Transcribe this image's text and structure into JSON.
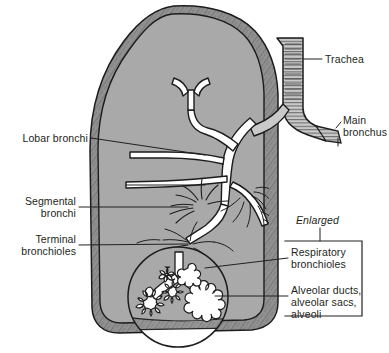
{
  "figure": {
    "width": 389,
    "height": 353,
    "background_color": "#ffffff"
  },
  "colors": {
    "lung_interior": "#a9a9a9",
    "pleura_border": "#909090",
    "ink": "#231f20",
    "airway_lumen": "#ffffff",
    "leader_line": "#231f20",
    "bracket": "#231f20"
  },
  "labels": {
    "trachea": "Trachea",
    "main_bronchus_line1": "Main",
    "main_bronchus_line2": "bronchus",
    "lobar_bronchi": "Lobar bronchi",
    "segmental_line1": "Segmental",
    "segmental_line2": "bronchi",
    "terminal_line1": "Terminal",
    "terminal_line2": "bronchioles",
    "enlarged": "Enlarged",
    "respiratory_line1": "Respiratory",
    "respiratory_line2": "bronchioles",
    "alveolar_line1": "Alveolar ducts,",
    "alveolar_line2": "alveolar sacs,",
    "alveolar_line3": "alveoli"
  },
  "structures": [
    {
      "name": "trachea",
      "label": "Trachea",
      "side": "right",
      "feature": "cartilage rings"
    },
    {
      "name": "main-bronchus",
      "label": "Main bronchus",
      "side": "right",
      "feature": "cartilage rings"
    },
    {
      "name": "lobar-bronchi",
      "label": "Lobar bronchi",
      "side": "left",
      "feature": "two leader lines"
    },
    {
      "name": "segmental-bronchi",
      "label": "Segmental bronchi",
      "side": "left",
      "feature": "single leader line"
    },
    {
      "name": "terminal-bronchioles",
      "label": "Terminal bronchioles",
      "side": "left",
      "feature": "single leader line"
    },
    {
      "name": "respiratory-bronchioles",
      "label": "Respiratory bronchioles",
      "side": "right",
      "feature": "bracketed, enlarged inset"
    },
    {
      "name": "alveolar-units",
      "label": "Alveolar ducts, alveolar sacs, alveoli",
      "side": "right",
      "feature": "bracketed, enlarged inset"
    }
  ],
  "inset": {
    "kind": "circular magnification",
    "caption": "Enlarged",
    "center_x": 178,
    "center_y": 297,
    "radius": 50
  }
}
